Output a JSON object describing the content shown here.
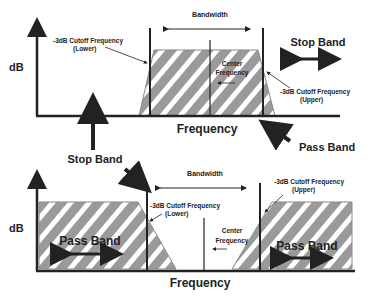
{
  "diagram": {
    "top": {
      "y_label": "dB",
      "x_label": "Frequency",
      "bandwidth_label": "Bandwidth",
      "lower_cutoff_label": [
        "-3dB Cutoff Frequency",
        "(Lower)"
      ],
      "upper_cutoff_label": [
        "-3dB Cutoff Frequency",
        "(Upper)"
      ],
      "center_label": [
        "Center",
        "Frequency"
      ],
      "stop_band_label": "Stop Band",
      "pass_band_label": "Pass Band"
    },
    "middle": {
      "stop_band_label": "Stop Band"
    },
    "bottom": {
      "y_label": "dB",
      "x_label": "Frequency",
      "bandwidth_label": "Bandwidth",
      "lower_cutoff_label": [
        "-3dB Cutoff Frequency",
        "(Lower)"
      ],
      "upper_cutoff_label": [
        "-3dB Cutoff Frequency",
        "(Upper)"
      ],
      "center_label": [
        "Center",
        "Frequency"
      ],
      "pass_band_left_label": "Pass Band",
      "pass_band_right_label": "Pass Band"
    },
    "colors": {
      "fill": "#9a9a9a",
      "stripe": "#ffffff",
      "line": "#222222"
    }
  }
}
